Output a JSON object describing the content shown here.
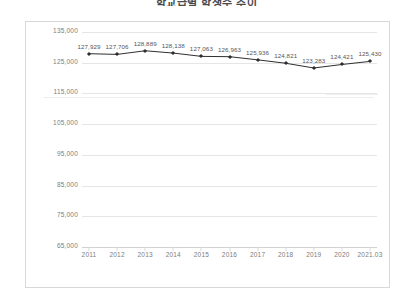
{
  "chart_data": {
    "type": "line",
    "title": "학교급별 학생수 추이",
    "xlabel": "",
    "ylabel": "",
    "categories": [
      "2011",
      "2012",
      "2013",
      "2014",
      "2015",
      "2016",
      "2017",
      "2018",
      "2019",
      "2020",
      "2021.03"
    ],
    "values": [
      127929,
      127706,
      128889,
      128138,
      127063,
      126963,
      125936,
      124821,
      123283,
      124421,
      125430
    ],
    "value_labels": [
      "127,929",
      "127,706",
      "128,889",
      "128,138",
      "127,063",
      "126,963",
      "125,936",
      "124,821",
      "123,283",
      "124,421",
      "125,430"
    ],
    "ylim": [
      65000,
      135000
    ],
    "yticks": [
      135000,
      125000,
      115000,
      105000,
      95000,
      85000,
      75000,
      65000
    ],
    "ytick_labels": [
      "135,000",
      "125,000",
      "115,000",
      "105,000",
      "95,000",
      "85,000",
      "75,000",
      "65,000"
    ],
    "grid": true,
    "legend": false,
    "series_color": "#2f2f2f",
    "grid_color": "#e6e6e6",
    "frame_color": "#d8d8d8",
    "label_color": "#7d7d7d"
  }
}
